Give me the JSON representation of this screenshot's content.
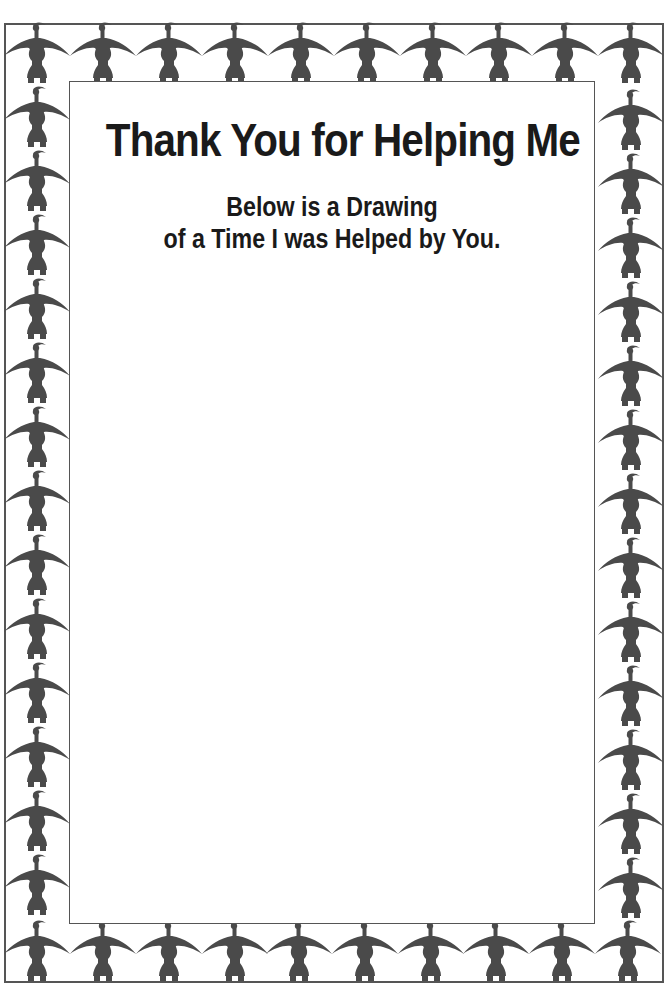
{
  "page": {
    "title": "Thank You for Helping Me",
    "subtitle": {
      "line1": "Below is a Drawing",
      "line2": "of a Time I was Helped by You."
    }
  },
  "border": {
    "motif": "bird-figure-icon",
    "figure_color": "#4a4a4a",
    "frame_color": "#555555",
    "top_row_count": 10,
    "bottom_row_count": 10,
    "left_column_count": 15,
    "right_column_count": 15
  },
  "drawing_area": {
    "content": ""
  }
}
